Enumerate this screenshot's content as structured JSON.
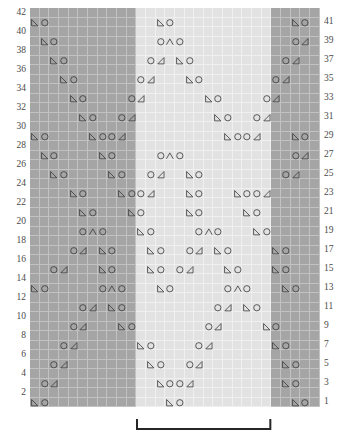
{
  "chart_data": {
    "type": "table",
    "grid": {
      "columns": 30,
      "rows": 42
    },
    "row_numbers_left": [
      42,
      40,
      38,
      36,
      34,
      32,
      30,
      28,
      26,
      24,
      22,
      20,
      18,
      16,
      14,
      12,
      10,
      8,
      6,
      4,
      2
    ],
    "row_numbers_right": [
      41,
      39,
      37,
      35,
      33,
      31,
      29,
      27,
      25,
      23,
      21,
      19,
      17,
      15,
      13,
      11,
      9,
      7,
      5,
      3,
      1
    ],
    "shading": {
      "note": "background blocks by column index (0-based)",
      "dark_left_cols": [
        0,
        11
      ],
      "light_center_cols": [
        11,
        25
      ],
      "dark_right_cols": [
        25,
        30
      ],
      "dark_color": "#a5a5a5",
      "light_color": "#e2e2e2",
      "gridline_color": "#dcdcdc"
    },
    "symbol_legend": [
      {
        "key": "k2tog_left",
        "name": "left-leaning-decrease",
        "glyph": "left-triangle"
      },
      {
        "key": "yo",
        "name": "yarn-over",
        "glyph": "circle"
      },
      {
        "key": "cdd",
        "name": "centered-double-decrease",
        "glyph": "chevron-up"
      },
      {
        "key": "k2tog_right",
        "name": "right-leaning-decrease",
        "glyph": "right-triangle"
      }
    ],
    "rows": [
      {
        "n": 42,
        "cells": []
      },
      {
        "n": 41,
        "cells": [
          {
            "c": 0,
            "s": "k2tog_left"
          },
          {
            "c": 1,
            "s": "yo"
          },
          {
            "c": 13,
            "s": "k2tog_left"
          },
          {
            "c": 14,
            "s": "yo"
          },
          {
            "c": 27,
            "s": "k2tog_left"
          },
          {
            "c": 28,
            "s": "yo"
          }
        ]
      },
      {
        "n": 40,
        "cells": []
      },
      {
        "n": 39,
        "cells": [
          {
            "c": 1,
            "s": "k2tog_left"
          },
          {
            "c": 2,
            "s": "yo"
          },
          {
            "c": 13,
            "s": "yo"
          },
          {
            "c": 14,
            "s": "cdd"
          },
          {
            "c": 15,
            "s": "yo"
          },
          {
            "c": 27,
            "s": "yo"
          },
          {
            "c": 28,
            "s": "k2tog_right"
          }
        ]
      },
      {
        "n": 38,
        "cells": []
      },
      {
        "n": 37,
        "cells": [
          {
            "c": 2,
            "s": "k2tog_left"
          },
          {
            "c": 3,
            "s": "yo"
          },
          {
            "c": 12,
            "s": "yo"
          },
          {
            "c": 13,
            "s": "k2tog_right"
          },
          {
            "c": 15,
            "s": "k2tog_left"
          },
          {
            "c": 16,
            "s": "yo"
          },
          {
            "c": 26,
            "s": "yo"
          },
          {
            "c": 27,
            "s": "k2tog_right"
          }
        ]
      },
      {
        "n": 36,
        "cells": []
      },
      {
        "n": 35,
        "cells": [
          {
            "c": 3,
            "s": "k2tog_left"
          },
          {
            "c": 4,
            "s": "yo"
          },
          {
            "c": 11,
            "s": "yo"
          },
          {
            "c": 12,
            "s": "k2tog_right"
          },
          {
            "c": 16,
            "s": "k2tog_left"
          },
          {
            "c": 17,
            "s": "yo"
          },
          {
            "c": 25,
            "s": "yo"
          },
          {
            "c": 26,
            "s": "k2tog_right"
          }
        ]
      },
      {
        "n": 34,
        "cells": []
      },
      {
        "n": 33,
        "cells": [
          {
            "c": 4,
            "s": "k2tog_left"
          },
          {
            "c": 5,
            "s": "yo"
          },
          {
            "c": 10,
            "s": "yo"
          },
          {
            "c": 11,
            "s": "k2tog_right"
          },
          {
            "c": 18,
            "s": "k2tog_left"
          },
          {
            "c": 19,
            "s": "yo"
          },
          {
            "c": 24,
            "s": "yo"
          },
          {
            "c": 25,
            "s": "k2tog_right"
          }
        ]
      },
      {
        "n": 32,
        "cells": []
      },
      {
        "n": 31,
        "cells": [
          {
            "c": 5,
            "s": "k2tog_left"
          },
          {
            "c": 6,
            "s": "yo"
          },
          {
            "c": 9,
            "s": "yo"
          },
          {
            "c": 10,
            "s": "k2tog_right"
          },
          {
            "c": 19,
            "s": "k2tog_left"
          },
          {
            "c": 20,
            "s": "yo"
          },
          {
            "c": 23,
            "s": "yo"
          },
          {
            "c": 24,
            "s": "k2tog_right"
          }
        ]
      },
      {
        "n": 30,
        "cells": []
      },
      {
        "n": 29,
        "cells": [
          {
            "c": 0,
            "s": "k2tog_left"
          },
          {
            "c": 1,
            "s": "yo"
          },
          {
            "c": 6,
            "s": "k2tog_left"
          },
          {
            "c": 7,
            "s": "yo"
          },
          {
            "c": 8,
            "s": "yo"
          },
          {
            "c": 9,
            "s": "k2tog_right"
          },
          {
            "c": 20,
            "s": "k2tog_left"
          },
          {
            "c": 21,
            "s": "yo"
          },
          {
            "c": 22,
            "s": "yo"
          },
          {
            "c": 23,
            "s": "k2tog_right"
          },
          {
            "c": 27,
            "s": "k2tog_left"
          },
          {
            "c": 28,
            "s": "yo"
          }
        ]
      },
      {
        "n": 28,
        "cells": []
      },
      {
        "n": 27,
        "cells": [
          {
            "c": 1,
            "s": "k2tog_left"
          },
          {
            "c": 2,
            "s": "yo"
          },
          {
            "c": 7,
            "s": "k2tog_left"
          },
          {
            "c": 8,
            "s": "yo"
          },
          {
            "c": 13,
            "s": "yo"
          },
          {
            "c": 14,
            "s": "cdd"
          },
          {
            "c": 15,
            "s": "yo"
          },
          {
            "c": 27,
            "s": "yo"
          },
          {
            "c": 28,
            "s": "k2tog_right"
          }
        ]
      },
      {
        "n": 26,
        "cells": []
      },
      {
        "n": 25,
        "cells": [
          {
            "c": 2,
            "s": "k2tog_left"
          },
          {
            "c": 3,
            "s": "yo"
          },
          {
            "c": 8,
            "s": "k2tog_left"
          },
          {
            "c": 9,
            "s": "yo"
          },
          {
            "c": 12,
            "s": "yo"
          },
          {
            "c": 13,
            "s": "k2tog_right"
          },
          {
            "c": 16,
            "s": "k2tog_left"
          },
          {
            "c": 17,
            "s": "yo"
          },
          {
            "c": 26,
            "s": "yo"
          },
          {
            "c": 27,
            "s": "k2tog_right"
          }
        ]
      },
      {
        "n": 24,
        "cells": []
      },
      {
        "n": 23,
        "cells": [
          {
            "c": 4,
            "s": "k2tog_left"
          },
          {
            "c": 5,
            "s": "yo"
          },
          {
            "c": 9,
            "s": "k2tog_left"
          },
          {
            "c": 10,
            "s": "yo"
          },
          {
            "c": 11,
            "s": "yo"
          },
          {
            "c": 12,
            "s": "k2tog_right"
          },
          {
            "c": 16,
            "s": "k2tog_left"
          },
          {
            "c": 17,
            "s": "yo"
          },
          {
            "c": 21,
            "s": "k2tog_left"
          },
          {
            "c": 22,
            "s": "yo"
          },
          {
            "c": 23,
            "s": "yo"
          },
          {
            "c": 24,
            "s": "k2tog_right"
          }
        ]
      },
      {
        "n": 22,
        "cells": []
      },
      {
        "n": 21,
        "cells": [
          {
            "c": 5,
            "s": "k2tog_left"
          },
          {
            "c": 6,
            "s": "yo"
          },
          {
            "c": 10,
            "s": "k2tog_left"
          },
          {
            "c": 11,
            "s": "yo"
          },
          {
            "c": 16,
            "s": "k2tog_left"
          },
          {
            "c": 17,
            "s": "yo"
          },
          {
            "c": 22,
            "s": "k2tog_left"
          },
          {
            "c": 23,
            "s": "yo"
          }
        ]
      },
      {
        "n": 20,
        "cells": []
      },
      {
        "n": 19,
        "cells": [
          {
            "c": 5,
            "s": "yo"
          },
          {
            "c": 6,
            "s": "cdd"
          },
          {
            "c": 7,
            "s": "yo"
          },
          {
            "c": 11,
            "s": "k2tog_left"
          },
          {
            "c": 12,
            "s": "yo"
          },
          {
            "c": 17,
            "s": "yo"
          },
          {
            "c": 18,
            "s": "cdd"
          },
          {
            "c": 19,
            "s": "yo"
          },
          {
            "c": 23,
            "s": "k2tog_left"
          },
          {
            "c": 24,
            "s": "yo"
          }
        ]
      },
      {
        "n": 18,
        "cells": []
      },
      {
        "n": 17,
        "cells": [
          {
            "c": 4,
            "s": "yo"
          },
          {
            "c": 5,
            "s": "k2tog_right"
          },
          {
            "c": 7,
            "s": "k2tog_left"
          },
          {
            "c": 8,
            "s": "yo"
          },
          {
            "c": 12,
            "s": "k2tog_left"
          },
          {
            "c": 13,
            "s": "yo"
          },
          {
            "c": 16,
            "s": "yo"
          },
          {
            "c": 17,
            "s": "k2tog_right"
          },
          {
            "c": 19,
            "s": "k2tog_left"
          },
          {
            "c": 20,
            "s": "yo"
          },
          {
            "c": 25,
            "s": "k2tog_left"
          },
          {
            "c": 26,
            "s": "yo"
          }
        ]
      },
      {
        "n": 16,
        "cells": []
      },
      {
        "n": 15,
        "cells": [
          {
            "c": 2,
            "s": "yo"
          },
          {
            "c": 3,
            "s": "k2tog_right"
          },
          {
            "c": 7,
            "s": "k2tog_left"
          },
          {
            "c": 8,
            "s": "yo"
          },
          {
            "c": 12,
            "s": "k2tog_left"
          },
          {
            "c": 13,
            "s": "yo"
          },
          {
            "c": 15,
            "s": "yo"
          },
          {
            "c": 16,
            "s": "k2tog_right"
          },
          {
            "c": 20,
            "s": "k2tog_left"
          },
          {
            "c": 21,
            "s": "yo"
          },
          {
            "c": 25,
            "s": "k2tog_left"
          },
          {
            "c": 26,
            "s": "yo"
          }
        ]
      },
      {
        "n": 14,
        "cells": []
      },
      {
        "n": 13,
        "cells": [
          {
            "c": 0,
            "s": "k2tog_left"
          },
          {
            "c": 1,
            "s": "yo"
          },
          {
            "c": 7,
            "s": "yo"
          },
          {
            "c": 8,
            "s": "cdd"
          },
          {
            "c": 9,
            "s": "yo"
          },
          {
            "c": 13,
            "s": "k2tog_left"
          },
          {
            "c": 14,
            "s": "yo"
          },
          {
            "c": 20,
            "s": "yo"
          },
          {
            "c": 21,
            "s": "cdd"
          },
          {
            "c": 22,
            "s": "yo"
          },
          {
            "c": 26,
            "s": "k2tog_left"
          },
          {
            "c": 27,
            "s": "yo"
          }
        ]
      },
      {
        "n": 12,
        "cells": []
      },
      {
        "n": 11,
        "cells": [
          {
            "c": 5,
            "s": "yo"
          },
          {
            "c": 6,
            "s": "k2tog_right"
          },
          {
            "c": 8,
            "s": "k2tog_left"
          },
          {
            "c": 9,
            "s": "yo"
          },
          {
            "c": 19,
            "s": "yo"
          },
          {
            "c": 20,
            "s": "k2tog_right"
          },
          {
            "c": 22,
            "s": "k2tog_left"
          },
          {
            "c": 23,
            "s": "yo"
          }
        ]
      },
      {
        "n": 10,
        "cells": []
      },
      {
        "n": 9,
        "cells": [
          {
            "c": 4,
            "s": "yo"
          },
          {
            "c": 5,
            "s": "k2tog_right"
          },
          {
            "c": 9,
            "s": "k2tog_left"
          },
          {
            "c": 10,
            "s": "yo"
          },
          {
            "c": 18,
            "s": "yo"
          },
          {
            "c": 19,
            "s": "k2tog_right"
          },
          {
            "c": 24,
            "s": "k2tog_left"
          },
          {
            "c": 25,
            "s": "yo"
          }
        ]
      },
      {
        "n": 8,
        "cells": []
      },
      {
        "n": 7,
        "cells": [
          {
            "c": 3,
            "s": "yo"
          },
          {
            "c": 4,
            "s": "k2tog_right"
          },
          {
            "c": 11,
            "s": "k2tog_left"
          },
          {
            "c": 12,
            "s": "yo"
          },
          {
            "c": 17,
            "s": "yo"
          },
          {
            "c": 18,
            "s": "k2tog_right"
          },
          {
            "c": 25,
            "s": "k2tog_left"
          },
          {
            "c": 26,
            "s": "yo"
          }
        ]
      },
      {
        "n": 6,
        "cells": []
      },
      {
        "n": 5,
        "cells": [
          {
            "c": 2,
            "s": "yo"
          },
          {
            "c": 3,
            "s": "k2tog_right"
          },
          {
            "c": 12,
            "s": "k2tog_left"
          },
          {
            "c": 13,
            "s": "yo"
          },
          {
            "c": 16,
            "s": "yo"
          },
          {
            "c": 17,
            "s": "k2tog_right"
          },
          {
            "c": 26,
            "s": "k2tog_left"
          },
          {
            "c": 27,
            "s": "yo"
          }
        ]
      },
      {
        "n": 4,
        "cells": []
      },
      {
        "n": 3,
        "cells": [
          {
            "c": 1,
            "s": "yo"
          },
          {
            "c": 2,
            "s": "k2tog_right"
          },
          {
            "c": 13,
            "s": "k2tog_left"
          },
          {
            "c": 14,
            "s": "yo"
          },
          {
            "c": 15,
            "s": "yo"
          },
          {
            "c": 16,
            "s": "k2tog_right"
          },
          {
            "c": 26,
            "s": "k2tog_left"
          },
          {
            "c": 27,
            "s": "yo"
          }
        ]
      },
      {
        "n": 2,
        "cells": []
      },
      {
        "n": 1,
        "cells": [
          {
            "c": 0,
            "s": "k2tog_left"
          },
          {
            "c": 1,
            "s": "yo"
          },
          {
            "c": 14,
            "s": "k2tog_left"
          },
          {
            "c": 15,
            "s": "yo"
          },
          {
            "c": 27,
            "s": "k2tog_left"
          },
          {
            "c": 28,
            "s": "yo"
          }
        ]
      }
    ],
    "repeat_bracket": {
      "start_col": 11,
      "end_col": 25,
      "label": ""
    }
  }
}
